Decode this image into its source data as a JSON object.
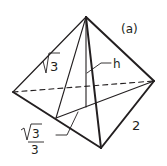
{
  "figure": {
    "panel_label": "(a)",
    "shape": "regular tetrahedron",
    "colors": {
      "stroke": "#231f20",
      "background": "#ffffff"
    },
    "vertices": {
      "apex": [
        86,
        17
      ],
      "left": [
        13,
        92
      ],
      "right": [
        154,
        81
      ],
      "bottom": [
        101,
        148
      ]
    },
    "labels": {
      "slant_height": {
        "radicand": "3",
        "text": "√3"
      },
      "height": "h",
      "edge": "2",
      "inradius": {
        "numerator_radicand": "3",
        "denominator": "3",
        "text": "√3/3"
      }
    }
  }
}
